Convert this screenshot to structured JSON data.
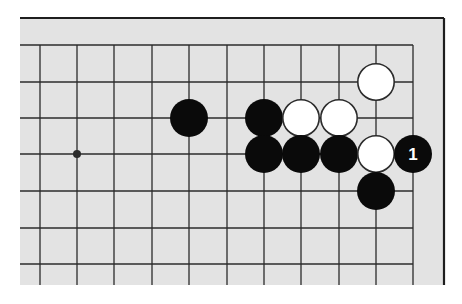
{
  "diagram": {
    "type": "go-board-fragment",
    "colors": {
      "page_background": "#ffffff",
      "board_background": "#e3e3e3",
      "grid_line": "#2b2b2b",
      "border_line": "#1e1e1e",
      "black_stone": "#0a0a0a",
      "white_stone": "#ffffff",
      "white_stone_outline": "#2b2b2b",
      "move_label_on_black": "#ffffff"
    },
    "board": {
      "x": 20,
      "y": 18,
      "width": 424,
      "height": 267,
      "top_border_y": 18,
      "right_border_x": 444
    },
    "grid": {
      "columns_x": [
        40,
        77,
        114,
        152,
        189,
        227,
        264,
        301,
        339,
        376,
        413
      ],
      "rows_y": [
        45,
        82,
        118,
        154,
        191,
        228,
        264
      ],
      "top_edge_row_y": 45,
      "right_edge_col_x": 413,
      "extend_left_to": 20,
      "extend_bottom_to": 285
    },
    "star_points": [
      {
        "x": 77,
        "y": 154
      }
    ],
    "stone_radius": 19,
    "stones": [
      {
        "color": "black",
        "x": 189,
        "y": 118
      },
      {
        "color": "black",
        "x": 264,
        "y": 118
      },
      {
        "color": "white",
        "x": 301,
        "y": 118
      },
      {
        "color": "white",
        "x": 339,
        "y": 118
      },
      {
        "color": "white",
        "x": 376,
        "y": 82
      },
      {
        "color": "black",
        "x": 264,
        "y": 154
      },
      {
        "color": "black",
        "x": 301,
        "y": 154
      },
      {
        "color": "black",
        "x": 339,
        "y": 154
      },
      {
        "color": "white",
        "x": 376,
        "y": 154
      },
      {
        "color": "black",
        "x": 413,
        "y": 154,
        "label": "1"
      },
      {
        "color": "black",
        "x": 376,
        "y": 191
      }
    ]
  }
}
